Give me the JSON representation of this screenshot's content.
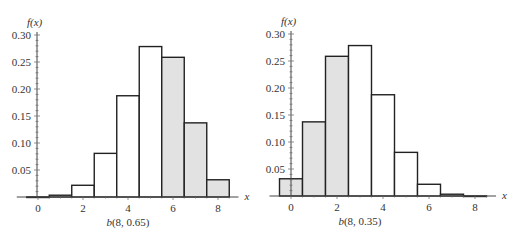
{
  "chart_data": [
    {
      "type": "bar",
      "title": "",
      "caption": "b(8, 0.65)",
      "caption_italic_part": "b",
      "caption_rest": "(8, 0.65)",
      "xlabel": "x",
      "ylabel": "f(x)",
      "x": [
        0,
        1,
        2,
        3,
        4,
        5,
        6,
        7,
        8
      ],
      "values": [
        0.0002,
        0.0033,
        0.0217,
        0.0808,
        0.1875,
        0.2786,
        0.2587,
        0.1373,
        0.0319
      ],
      "shaded": [
        false,
        false,
        false,
        false,
        false,
        false,
        true,
        true,
        true
      ],
      "xticks": [
        0,
        2,
        4,
        6,
        8
      ],
      "yticks": [
        0.05,
        0.1,
        0.15,
        0.2,
        0.25,
        0.3
      ],
      "ytick_labels": [
        "0.05",
        "0.10",
        "0.15",
        "0.20",
        "0.25",
        "0.30"
      ],
      "xlim": [
        -0.5,
        9
      ],
      "ylim": [
        0,
        0.3
      ],
      "grid": false
    },
    {
      "type": "bar",
      "title": "",
      "caption": "b(8, 0.35)",
      "caption_italic_part": "b",
      "caption_rest": "(8, 0.35)",
      "xlabel": "x",
      "ylabel": "f(x)",
      "x": [
        0,
        1,
        2,
        3,
        4,
        5,
        6,
        7,
        8
      ],
      "values": [
        0.0319,
        0.1373,
        0.2587,
        0.2786,
        0.1875,
        0.0808,
        0.0217,
        0.0033,
        0.0002
      ],
      "shaded": [
        true,
        true,
        true,
        false,
        false,
        false,
        false,
        false,
        false
      ],
      "xticks": [
        0,
        2,
        4,
        6,
        8
      ],
      "yticks": [
        0.05,
        0.1,
        0.15,
        0.2,
        0.25,
        0.3
      ],
      "ytick_labels": [
        "0.05",
        "0.10",
        "0.15",
        "0.20",
        "0.25",
        "0.30"
      ],
      "xlim": [
        -0.5,
        9
      ],
      "ylim": [
        0,
        0.3
      ],
      "grid": false
    }
  ],
  "colors": {
    "shaded_fill": "#e2e2e2",
    "bar_fill": "#ffffff",
    "stroke": "#222222"
  }
}
